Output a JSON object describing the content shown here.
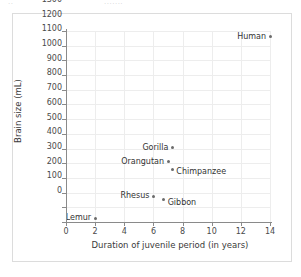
{
  "top_fragment": {
    "left_text": "..",
    "right_text": "......."
  },
  "chart_data": {
    "type": "scatter",
    "title": "",
    "xlabel": "Duration of juvenile period (in years)",
    "ylabel": "Brain size (mL)",
    "xlim": [
      0,
      14
    ],
    "ylim": [
      0,
      1300
    ],
    "xticks": [
      0,
      2,
      4,
      6,
      8,
      10,
      12,
      14
    ],
    "yticks": [
      0,
      100,
      200,
      300,
      400,
      500,
      600,
      700,
      800,
      900,
      1000,
      1100,
      1200,
      1300
    ],
    "xtick_labels": [
      "0",
      "2",
      "4",
      "6",
      "8",
      "10",
      "12",
      "14"
    ],
    "ytick_labels": [
      "0",
      "100",
      "200",
      "300",
      "400",
      "500",
      "600",
      "700",
      "800",
      "900",
      "1000",
      "1100",
      "1200",
      "1300"
    ],
    "grid": true,
    "legend": "none",
    "marker_color": "#6b6b6b",
    "grid_color": "#ededed",
    "axis_color": "#8a8a8a",
    "points": [
      {
        "label": "Human",
        "x": 14.0,
        "y": 1260,
        "label_side": "left"
      },
      {
        "label": "Gorilla",
        "x": 7.3,
        "y": 505,
        "label_side": "left"
      },
      {
        "label": "Orangutan",
        "x": 7.0,
        "y": 410,
        "label_side": "left"
      },
      {
        "label": "Chimpanzee",
        "x": 7.3,
        "y": 360,
        "label_side": "right"
      },
      {
        "label": "Rhesus",
        "x": 6.0,
        "y": 175,
        "label_side": "left"
      },
      {
        "label": "Gibbon",
        "x": 6.7,
        "y": 150,
        "label_side": "right"
      },
      {
        "label": "Lemur",
        "x": 2.0,
        "y": 25,
        "label_side": "left"
      }
    ]
  }
}
